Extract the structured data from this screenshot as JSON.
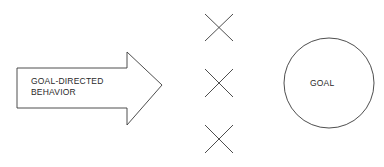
{
  "diagram": {
    "arrow": {
      "label_line1": "GOAL-DIRECTED",
      "label_line2": "BEHAVIOR"
    },
    "barriers": [
      {
        "symbol": "x",
        "position": "top"
      },
      {
        "symbol": "x",
        "position": "middle"
      },
      {
        "symbol": "x",
        "position": "bottom"
      }
    ],
    "goal": {
      "label": "GOAL"
    },
    "colors": {
      "stroke": "#3a3a3a",
      "background": "#ffffff"
    }
  }
}
